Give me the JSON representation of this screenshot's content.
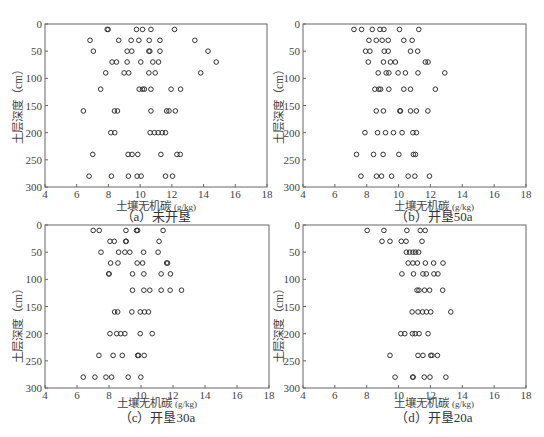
{
  "figure": {
    "panels": [
      {
        "id": "a",
        "caption": "（a）未开垦",
        "xlabel": "土壤无机碳",
        "xunit": "(g/kg)",
        "ylabel": "土层深度（cm）"
      },
      {
        "id": "b",
        "caption": "（b）开垦50a",
        "xlabel": "土壤无机碳",
        "xunit": "(g/kg)",
        "ylabel": "土层深度（cm）"
      },
      {
        "id": "c",
        "caption": "（c）开垦30a",
        "xlabel": "土壤无机碳",
        "xunit": "(g/kg)",
        "ylabel": "土层深度（cm）"
      },
      {
        "id": "d",
        "caption": "（d）开垦20a",
        "xlabel": "土壤无机碳",
        "xunit": "(g/kg)",
        "ylabel": "土层深度（cm）"
      }
    ],
    "colors": {
      "marker": "#333333",
      "axis": "#666666",
      "text": "#444444"
    }
  },
  "chart_data": [
    {
      "type": "scatter",
      "title": "（a）未开垦",
      "xlabel": "土壤无机碳 (g/kg)",
      "ylabel": "土层深度（cm）",
      "xlim": [
        4,
        18
      ],
      "ylim": [
        0,
        300
      ],
      "y_inverted": true,
      "xticks": [
        4,
        6,
        8,
        10,
        12,
        14,
        16,
        18
      ],
      "yticks": [
        0,
        50,
        100,
        150,
        200,
        250,
        300
      ],
      "grid": false,
      "marker": "open-circle",
      "points": [
        {
          "depth": 10,
          "values": [
            7.92,
            7.98,
            9.77,
            10.15,
            10.68,
            12.17
          ]
        },
        {
          "depth": 30,
          "values": [
            6.84,
            8.65,
            9.43,
            9.92,
            10.57,
            11.25,
            13.45
          ]
        },
        {
          "depth": 50,
          "values": [
            7.05,
            9.18,
            9.47,
            10.55,
            10.61,
            11.25,
            14.28
          ]
        },
        {
          "depth": 70,
          "values": [
            8.23,
            8.51,
            9.18,
            10.04,
            10.8,
            11.16,
            14.8
          ]
        },
        {
          "depth": 90,
          "values": [
            7.83,
            8.99,
            9.28,
            10.55,
            10.95,
            13.82
          ]
        },
        {
          "depth": 120,
          "values": [
            7.51,
            9.94,
            10.15,
            10.27,
            10.68,
            11.95,
            12.55
          ]
        },
        {
          "depth": 160,
          "values": [
            6.42,
            8.38,
            8.57,
            10.68,
            11.67,
            11.82,
            12.22
          ]
        },
        {
          "depth": 200,
          "values": [
            8.15,
            8.4,
            10.63,
            10.9,
            11.14,
            11.39,
            11.6
          ]
        },
        {
          "depth": 240,
          "values": [
            7.01,
            9.24,
            9.49,
            9.85,
            11.31,
            12.32,
            12.53
          ]
        },
        {
          "depth": 280,
          "values": [
            6.78,
            8.19,
            9.26,
            9.81,
            10.06,
            11.6,
            12.04
          ]
        }
      ]
    },
    {
      "type": "scatter",
      "title": "（b）开垦50a",
      "xlabel": "土壤无机碳 (g/kg)",
      "ylabel": "土层深度（cm）",
      "xlim": [
        4,
        18
      ],
      "ylim": [
        0,
        300
      ],
      "y_inverted": true,
      "xticks": [
        4,
        6,
        8,
        10,
        12,
        14,
        16,
        18
      ],
      "yticks": [
        0,
        50,
        100,
        150,
        200,
        250,
        300
      ],
      "grid": false,
      "marker": "open-circle",
      "points": [
        {
          "depth": 10,
          "values": [
            7.2,
            7.68,
            8.35,
            8.83,
            9.08,
            10.06,
            11.27
          ]
        },
        {
          "depth": 30,
          "values": [
            8.14,
            8.6,
            8.97,
            9.35,
            10.33,
            10.85
          ]
        },
        {
          "depth": 50,
          "values": [
            7.93,
            8.2,
            9.1,
            9.35,
            10.75,
            11.2
          ]
        },
        {
          "depth": 70,
          "values": [
            8.1,
            9.05,
            9.49,
            9.8,
            11.68,
            11.85
          ]
        },
        {
          "depth": 90,
          "values": [
            8.72,
            9.22,
            9.39,
            9.97,
            10.43,
            11.22,
            12.9
          ]
        },
        {
          "depth": 120,
          "values": [
            8.51,
            8.76,
            8.87,
            9.39,
            10.33,
            10.75,
            12.31
          ]
        },
        {
          "depth": 160,
          "values": [
            8.6,
            9.05,
            10.08,
            10.12,
            10.75,
            11.12,
            11.84
          ]
        },
        {
          "depth": 200,
          "values": [
            7.89,
            8.68,
            9.18,
            9.68,
            10.22,
            10.9,
            11.12
          ]
        },
        {
          "depth": 240,
          "values": [
            7.36,
            8.43,
            9.03,
            10.02,
            10.93,
            11.06
          ]
        },
        {
          "depth": 280,
          "values": [
            7.64,
            8.61,
            8.93,
            9.56,
            10.6,
            11.02,
            11.94
          ]
        }
      ]
    },
    {
      "type": "scatter",
      "title": "（c）开垦30a",
      "xlabel": "土壤无机碳 (g/kg)",
      "ylabel": "土层深度（cm）",
      "xlim": [
        4,
        18
      ],
      "ylim": [
        0,
        300
      ],
      "y_inverted": true,
      "xticks": [
        4,
        6,
        8,
        10,
        12,
        14,
        16,
        18
      ],
      "yticks": [
        0,
        50,
        100,
        150,
        200,
        250,
        300
      ],
      "grid": false,
      "marker": "open-circle",
      "points": [
        {
          "depth": 10,
          "values": [
            7.01,
            7.39,
            9.06,
            9.72,
            9.79,
            11.38
          ]
        },
        {
          "depth": 30,
          "values": [
            8.06,
            8.33,
            9.04,
            9.08,
            11.13
          ]
        },
        {
          "depth": 50,
          "values": [
            7.5,
            8.6,
            8.99,
            9.3,
            10.16,
            11.07
          ]
        },
        {
          "depth": 70,
          "values": [
            8.1,
            8.56,
            9.76,
            10.1,
            11.6,
            11.66
          ]
        },
        {
          "depth": 90,
          "values": [
            7.98,
            8.01,
            9.47,
            10.18,
            11.26,
            11.84
          ]
        },
        {
          "depth": 120,
          "values": [
            9.47,
            10.18,
            10.55,
            11.26,
            11.82,
            12.53
          ]
        },
        {
          "depth": 160,
          "values": [
            8.35,
            8.54,
            9.43,
            9.95,
            10.22,
            10.47
          ]
        },
        {
          "depth": 200,
          "values": [
            8.06,
            8.48,
            8.73,
            8.99,
            9.95,
            10.7
          ]
        },
        {
          "depth": 240,
          "values": [
            7.37,
            8.26,
            8.83,
            9.79,
            9.85,
            10.2
          ]
        },
        {
          "depth": 280,
          "values": [
            6.39,
            7.12,
            7.81,
            8.16,
            9.2,
            9.99
          ]
        }
      ]
    },
    {
      "type": "scatter",
      "title": "（d）开垦20a",
      "xlabel": "土壤无机碳 (g/kg)",
      "ylabel": "土层深度（cm）",
      "xlim": [
        4,
        18
      ],
      "ylim": [
        0,
        300
      ],
      "y_inverted": true,
      "xticks": [
        4,
        6,
        8,
        10,
        12,
        14,
        16,
        18
      ],
      "yticks": [
        0,
        50,
        100,
        150,
        200,
        250,
        300
      ],
      "grid": false,
      "marker": "open-circle",
      "points": [
        {
          "depth": 10,
          "values": [
            8.03,
            9.08,
            10.52,
            11.36,
            11.67
          ]
        },
        {
          "depth": 30,
          "values": [
            8.96,
            9.46,
            10.17,
            10.47,
            11.47
          ]
        },
        {
          "depth": 50,
          "values": [
            10.49,
            10.69,
            10.9,
            11.07,
            11.26
          ]
        },
        {
          "depth": 70,
          "values": [
            10.6,
            10.9,
            11.18,
            11.68,
            12.2,
            12.79
          ]
        },
        {
          "depth": 90,
          "values": [
            10.21,
            10.94,
            11.53,
            11.74,
            12.22,
            12.47
          ]
        },
        {
          "depth": 120,
          "values": [
            11.16,
            11.28,
            11.63,
            11.95,
            12.77
          ]
        },
        {
          "depth": 160,
          "values": [
            10.85,
            11.22,
            11.5,
            11.75,
            12.02,
            13.28
          ]
        },
        {
          "depth": 200,
          "values": [
            10.14,
            10.39,
            10.87,
            11.04,
            11.29,
            11.85
          ]
        },
        {
          "depth": 240,
          "values": [
            9.46,
            11.22,
            11.53,
            12.02,
            12.1,
            12.44
          ]
        },
        {
          "depth": 280,
          "values": [
            9.78,
            10.88,
            10.92,
            11.61,
            11.97,
            12.97
          ]
        }
      ]
    }
  ]
}
